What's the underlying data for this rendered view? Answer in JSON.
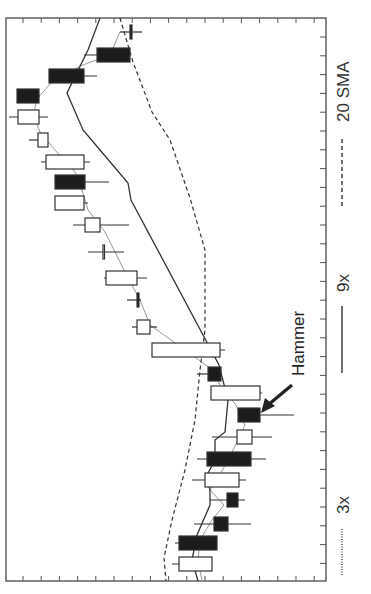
{
  "chart_data": {
    "type": "candlestick",
    "orientation": "rotated-90-clockwise",
    "title": "",
    "xlabel": "",
    "ylabel": "",
    "grid": false,
    "legend_position": "right (rotated, vertical)",
    "legend": [
      {
        "label": "3x",
        "style": "dotted",
        "color": "#9a9a9a"
      },
      {
        "label": "9x",
        "style": "solid",
        "color": "#333333"
      },
      {
        "label": "20 SMA",
        "style": "dashed",
        "color": "#333333"
      }
    ],
    "annotations": [
      {
        "text": "Hammer",
        "target_candle_index": 17,
        "arrow": true
      }
    ],
    "frame": {
      "left": 6,
      "top": 18,
      "right": 326,
      "bottom": 581
    },
    "candles": [
      {
        "y": 32,
        "body": [
          130,
          132
        ],
        "wick": [
          120,
          142
        ],
        "filled": true
      },
      {
        "y": 55,
        "body": [
          97,
          130
        ],
        "wick": [
          84,
          130
        ],
        "filled": true
      },
      {
        "y": 76,
        "body": [
          49,
          84
        ],
        "wick": [
          49,
          97
        ],
        "filled": true
      },
      {
        "y": 96,
        "body": [
          17,
          39
        ],
        "wick": [
          17,
          40
        ],
        "filled": true
      },
      {
        "y": 117,
        "body": [
          18,
          39
        ],
        "wick": [
          9,
          48
        ],
        "filled": false
      },
      {
        "y": 140,
        "body": [
          38,
          48
        ],
        "wick": [
          29,
          48
        ],
        "filled": false
      },
      {
        "y": 162,
        "body": [
          46,
          84
        ],
        "wick": [
          41,
          90
        ],
        "filled": false
      },
      {
        "y": 182,
        "body": [
          55,
          85
        ],
        "wick": [
          55,
          109
        ],
        "filled": true
      },
      {
        "y": 203,
        "body": [
          55,
          84
        ],
        "wick": [
          55,
          88
        ],
        "filled": false
      },
      {
        "y": 225,
        "body": [
          85,
          100
        ],
        "wick": [
          73,
          129
        ],
        "filled": false
      },
      {
        "y": 252,
        "body": [
          103,
          104
        ],
        "wick": [
          88,
          124
        ],
        "filled": false
      },
      {
        "y": 278,
        "body": [
          106,
          137
        ],
        "wick": [
          104,
          147
        ],
        "filled": false
      },
      {
        "y": 300,
        "body": [
          137,
          139
        ],
        "wick": [
          127,
          141
        ],
        "filled": true
      },
      {
        "y": 327,
        "body": [
          137,
          150
        ],
        "wick": [
          132,
          157
        ],
        "filled": false
      },
      {
        "y": 350,
        "body": [
          152,
          220
        ],
        "wick": [
          152,
          225
        ],
        "filled": false
      },
      {
        "y": 374,
        "body": [
          208,
          221
        ],
        "wick": [
          197,
          221
        ],
        "filled": true
      },
      {
        "y": 393,
        "body": [
          211,
          260
        ],
        "wick": [
          211,
          262
        ],
        "filled": false
      },
      {
        "y": 415,
        "body": [
          238,
          260
        ],
        "wick": [
          238,
          294
        ],
        "filled": true
      },
      {
        "y": 437,
        "body": [
          237,
          252
        ],
        "wick": [
          212,
          272
        ],
        "filled": false
      },
      {
        "y": 459,
        "body": [
          207,
          251
        ],
        "wick": [
          197,
          266
        ],
        "filled": true
      },
      {
        "y": 480,
        "body": [
          205,
          239
        ],
        "wick": [
          192,
          246
        ],
        "filled": false
      },
      {
        "y": 500,
        "body": [
          227,
          238
        ],
        "wick": [
          210,
          245
        ],
        "filled": true
      },
      {
        "y": 524,
        "body": [
          214,
          228
        ],
        "wick": [
          194,
          251
        ],
        "filled": true
      },
      {
        "y": 543,
        "body": [
          179,
          217
        ],
        "wick": [
          175,
          217
        ],
        "filled": true
      },
      {
        "y": 564,
        "body": [
          179,
          212
        ],
        "wick": [
          172,
          212
        ],
        "filled": false
      }
    ],
    "series": [
      {
        "name": "3x",
        "style": "dotted",
        "points": [
          [
            120,
            32
          ],
          [
            110,
            55
          ],
          [
            80,
            66
          ],
          [
            50,
            84
          ],
          [
            36,
            100
          ],
          [
            34,
            117
          ],
          [
            40,
            132
          ],
          [
            55,
            150
          ],
          [
            75,
            172
          ],
          [
            82,
            190
          ],
          [
            88,
            210
          ],
          [
            105,
            232
          ],
          [
            118,
            258
          ],
          [
            128,
            278
          ],
          [
            140,
            300
          ],
          [
            150,
            325
          ],
          [
            178,
            345
          ],
          [
            210,
            368
          ],
          [
            220,
            385
          ],
          [
            236,
            405
          ],
          [
            245,
            425
          ],
          [
            238,
            440
          ],
          [
            228,
            460
          ],
          [
            218,
            478
          ],
          [
            210,
            490
          ],
          [
            224,
            505
          ],
          [
            212,
            520
          ],
          [
            200,
            540
          ],
          [
            198,
            560
          ],
          [
            202,
            581
          ]
        ]
      },
      {
        "name": "9x",
        "style": "solid",
        "points": [
          [
            100,
            18
          ],
          [
            88,
            50
          ],
          [
            67,
            93
          ],
          [
            83,
            130
          ],
          [
            100,
            150
          ],
          [
            128,
            183
          ],
          [
            131,
            200
          ],
          [
            219,
            365
          ],
          [
            228,
            400
          ],
          [
            225,
            432
          ],
          [
            215,
            440
          ],
          [
            215,
            460
          ],
          [
            207,
            475
          ],
          [
            210,
            490
          ],
          [
            210,
            505
          ],
          [
            197,
            535
          ],
          [
            192,
            560
          ],
          [
            198,
            581
          ]
        ]
      },
      {
        "name": "20 SMA",
        "style": "dashed",
        "points": [
          [
            120,
            18
          ],
          [
            133,
            62
          ],
          [
            152,
            112
          ],
          [
            170,
            140
          ],
          [
            190,
            198
          ],
          [
            205,
            250
          ],
          [
            205,
            330
          ],
          [
            200,
            370
          ],
          [
            195,
            420
          ],
          [
            185,
            470
          ],
          [
            172,
            520
          ],
          [
            164,
            558
          ],
          [
            166,
            581
          ]
        ]
      }
    ]
  },
  "legend_labels": {
    "l3x": "3x",
    "l9x": "9x",
    "l20": "20 SMA"
  },
  "annotation_label": "Hammer"
}
